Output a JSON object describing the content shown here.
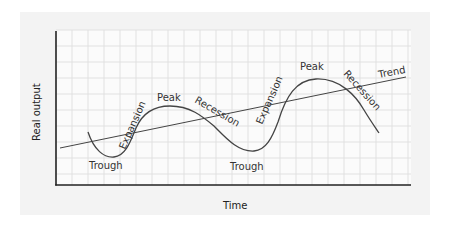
{
  "diagram": {
    "xlabel": "Time",
    "ylabel": "Real output",
    "trend_label": "Trend",
    "phase_labels": [
      {
        "text": "Trough"
      },
      {
        "text": "Expansion"
      },
      {
        "text": "Peak"
      },
      {
        "text": "Recession"
      },
      {
        "text": "Trough"
      },
      {
        "text": "Expansion"
      },
      {
        "text": "Peak"
      },
      {
        "text": "Recession"
      }
    ],
    "colors": {
      "panel": "#f3f3f3",
      "grid": "#dedede",
      "axis": "#222222",
      "curve": "#444444",
      "text": "#333333"
    }
  }
}
